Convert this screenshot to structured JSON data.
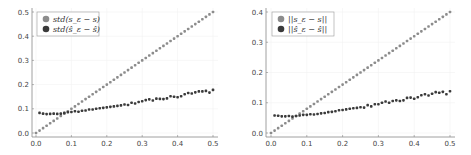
{
  "colors": {
    "light": "#8c8c8c",
    "dark": "#3a3a3a",
    "axis": "#888888",
    "grid": "#f2f2f2"
  },
  "chart_data": [
    {
      "type": "scatter",
      "title": "",
      "xlabel": "",
      "ylabel": "",
      "xlim": [
        0.0,
        0.5
      ],
      "ylim": [
        0.0,
        0.5
      ],
      "xticks": [
        "0.0",
        "0.1",
        "0.2",
        "0.3",
        "0.4",
        "0.5"
      ],
      "yticks": [
        "0.0",
        "0.1",
        "0.2",
        "0.3",
        "0.4",
        "0.5"
      ],
      "legend_position": "upper left",
      "grid": true,
      "x": [
        0.0,
        0.01,
        0.02,
        0.03,
        0.04,
        0.05,
        0.06,
        0.07,
        0.08,
        0.09,
        0.1,
        0.11,
        0.12,
        0.13,
        0.14,
        0.15,
        0.16,
        0.17,
        0.18,
        0.19,
        0.2,
        0.21,
        0.22,
        0.23,
        0.24,
        0.25,
        0.26,
        0.27,
        0.28,
        0.29,
        0.3,
        0.31,
        0.32,
        0.33,
        0.34,
        0.35,
        0.36,
        0.37,
        0.38,
        0.39,
        0.4,
        0.41,
        0.42,
        0.43,
        0.44,
        0.45,
        0.46,
        0.47,
        0.48,
        0.49,
        0.5
      ],
      "series": [
        {
          "name": "std(s_ε − s)",
          "color": "#8c8c8c",
          "values": [
            0.0,
            0.01,
            0.02,
            0.03,
            0.04,
            0.05,
            0.06,
            0.07,
            0.08,
            0.09,
            0.1,
            0.11,
            0.12,
            0.13,
            0.14,
            0.15,
            0.16,
            0.17,
            0.18,
            0.19,
            0.2,
            0.21,
            0.22,
            0.23,
            0.24,
            0.25,
            0.26,
            0.27,
            0.28,
            0.29,
            0.3,
            0.31,
            0.32,
            0.33,
            0.34,
            0.35,
            0.36,
            0.37,
            0.38,
            0.39,
            0.4,
            0.41,
            0.42,
            0.43,
            0.44,
            0.45,
            0.46,
            0.47,
            0.48,
            0.49,
            0.5
          ]
        },
        {
          "name": "std(ŝ_ε − ŝ)",
          "color": "#3a3a3a",
          "values": [
            null,
            0.083,
            0.08,
            0.078,
            0.079,
            0.08,
            0.079,
            0.08,
            0.083,
            0.086,
            0.087,
            0.09,
            0.088,
            0.092,
            0.093,
            0.097,
            0.097,
            0.1,
            0.102,
            0.104,
            0.106,
            0.108,
            0.11,
            0.112,
            0.114,
            0.118,
            0.116,
            0.125,
            0.122,
            0.128,
            0.131,
            0.136,
            0.139,
            0.134,
            0.142,
            0.141,
            0.14,
            0.143,
            0.152,
            0.15,
            0.148,
            0.152,
            0.16,
            0.165,
            0.163,
            0.168,
            0.172,
            0.172,
            0.174,
            0.167,
            0.178
          ]
        }
      ]
    },
    {
      "type": "scatter",
      "title": "",
      "xlabel": "",
      "ylabel": "",
      "xlim": [
        0.0,
        0.5
      ],
      "ylim": [
        0.0,
        0.4
      ],
      "xticks": [
        "0.0",
        "0.1",
        "0.2",
        "0.3",
        "0.4",
        "0.5"
      ],
      "yticks": [
        "0.0",
        "0.1",
        "0.2",
        "0.3",
        "0.4"
      ],
      "legend_position": "upper left",
      "grid": true,
      "x": [
        0.0,
        0.01,
        0.02,
        0.03,
        0.04,
        0.05,
        0.06,
        0.07,
        0.08,
        0.09,
        0.1,
        0.11,
        0.12,
        0.13,
        0.14,
        0.15,
        0.16,
        0.17,
        0.18,
        0.19,
        0.2,
        0.21,
        0.22,
        0.23,
        0.24,
        0.25,
        0.26,
        0.27,
        0.28,
        0.29,
        0.3,
        0.31,
        0.32,
        0.33,
        0.34,
        0.35,
        0.36,
        0.37,
        0.38,
        0.39,
        0.4,
        0.41,
        0.42,
        0.43,
        0.44,
        0.45,
        0.46,
        0.47,
        0.48,
        0.49,
        0.5
      ],
      "series": [
        {
          "name": "||s_ε − s||",
          "color": "#8c8c8c",
          "values": [
            0.0,
            0.008,
            0.016,
            0.024,
            0.032,
            0.04,
            0.048,
            0.056,
            0.064,
            0.072,
            0.08,
            0.088,
            0.096,
            0.104,
            0.112,
            0.12,
            0.128,
            0.136,
            0.144,
            0.152,
            0.16,
            0.168,
            0.176,
            0.184,
            0.192,
            0.2,
            0.208,
            0.216,
            0.224,
            0.232,
            0.24,
            0.248,
            0.256,
            0.264,
            0.272,
            0.28,
            0.288,
            0.296,
            0.304,
            0.312,
            0.32,
            0.328,
            0.336,
            0.344,
            0.352,
            0.36,
            0.368,
            0.376,
            0.384,
            0.392,
            0.4
          ]
        },
        {
          "name": "||ŝ_ε − ŝ||",
          "color": "#3a3a3a",
          "values": [
            null,
            0.058,
            0.057,
            0.055,
            0.055,
            0.056,
            0.054,
            0.056,
            0.058,
            0.06,
            0.06,
            0.062,
            0.061,
            0.063,
            0.065,
            0.066,
            0.069,
            0.07,
            0.072,
            0.075,
            0.076,
            0.078,
            0.08,
            0.082,
            0.083,
            0.085,
            0.084,
            0.092,
            0.088,
            0.095,
            0.095,
            0.1,
            0.104,
            0.1,
            0.106,
            0.108,
            0.106,
            0.108,
            0.116,
            0.117,
            0.113,
            0.118,
            0.125,
            0.128,
            0.124,
            0.13,
            0.135,
            0.133,
            0.136,
            0.128,
            0.138
          ]
        }
      ]
    }
  ]
}
